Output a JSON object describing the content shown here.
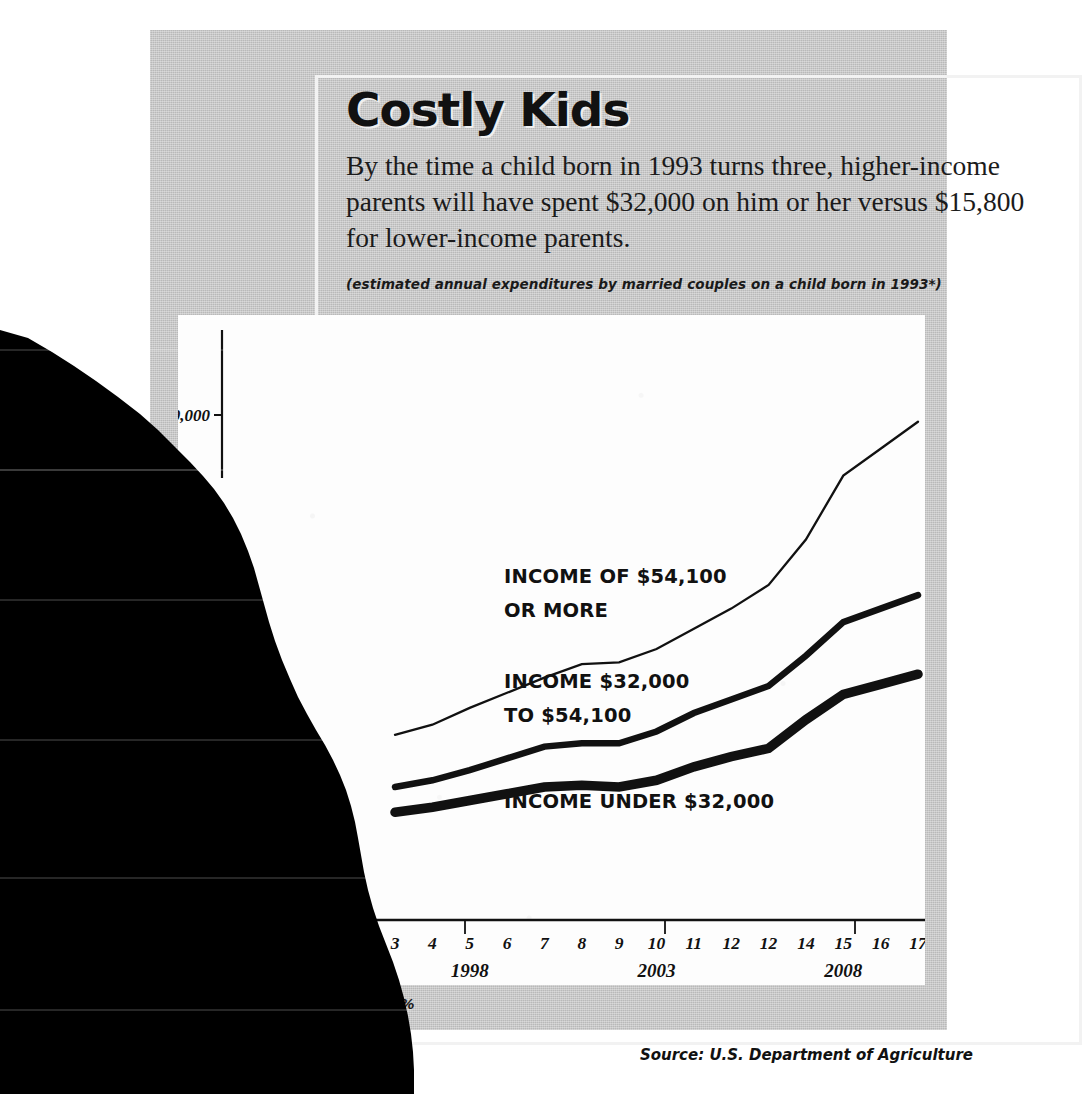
{
  "title": "Costly Kids",
  "deck": "By the time a child born in 1993 turns three, higher-income parents will have spent $32,000 on him or her versus $15,800 for lower-income parents.",
  "subdeck": "(estimated annual expenditures by married couples on a child born in 1993*)",
  "footnote": "n rate of 6%",
  "source": "Source: U.S. Department of Agriculture",
  "axis": {
    "y_tick_label": "$30,000",
    "year_labels": [
      "1998",
      "2003",
      "2008"
    ]
  },
  "series_labels": {
    "high_line1": "INCOME OF $54,100",
    "high_line2": "OR MORE",
    "mid_line1": "INCOME $32,000",
    "mid_line2": "TO $54,100",
    "low_line1": "INCOME UNDER $32,000"
  },
  "chart_data": {
    "type": "line",
    "title": "Costly Kids",
    "subtitle": "(estimated annual expenditures by married couples on a child born in 1993*)",
    "xlabel": "Age of child / year",
    "ylabel": "Annual expenditure",
    "categories": [
      "3",
      "4",
      "5",
      "6",
      "7",
      "8",
      "9",
      "10",
      "11",
      "12",
      "12",
      "14",
      "15",
      "16",
      "17"
    ],
    "year_ticks": [
      {
        "label": "1998",
        "category_index": 2
      },
      {
        "label": "2003",
        "category_index": 7
      },
      {
        "label": "2008",
        "category_index": 12
      }
    ],
    "ytick_values": [
      30000
    ],
    "ylim": [
      0,
      37000
    ],
    "grid": false,
    "legend": "inline-annotations",
    "series": [
      {
        "name": "INCOME OF $54,100 OR MORE",
        "stroke": "thin",
        "values": [
          11000,
          11600,
          12600,
          13500,
          14400,
          15200,
          15300,
          16100,
          17300,
          18500,
          19900,
          22600,
          26400,
          28000,
          29600
        ]
      },
      {
        "name": "INCOME $32,000 TO $54,100",
        "stroke": "medium",
        "values": [
          7900,
          8300,
          8900,
          9600,
          10300,
          10500,
          10500,
          11200,
          12300,
          13100,
          13900,
          15700,
          17700,
          18500,
          19300
        ]
      },
      {
        "name": "INCOME UNDER $32,000",
        "stroke": "thick",
        "values": [
          6400,
          6700,
          7100,
          7500,
          7900,
          8000,
          7900,
          8300,
          9100,
          9700,
          10200,
          11900,
          13400,
          14000,
          14600
        ]
      }
    ]
  },
  "colors": {
    "panel_gray": "#b9b9b9",
    "plot_white": "#fdfdfd",
    "ink": "#111111",
    "torn_overlay": "#000000"
  }
}
